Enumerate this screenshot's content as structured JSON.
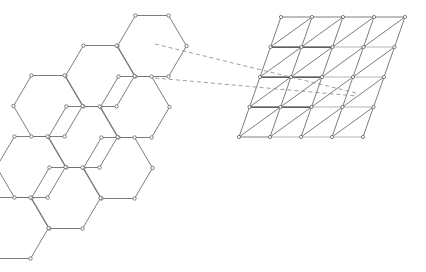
{
  "figure": {
    "background_color": "#ffffff",
    "width": 426,
    "height": 272
  },
  "colors": {
    "edge_normal": "#6e6e6e",
    "edge_dark": "#2a2a2a",
    "edge_light": "#b4b4b4",
    "node_fill": "#ffffff",
    "node_stroke": "#5a5a5a",
    "callout": "#8d8d8d"
  },
  "chart_data": {
    "type": "diagram",
    "xlabel": "",
    "ylabel": "",
    "grid": false,
    "legend": "none",
    "panels": [
      {
        "name": "honeycomb-lattice",
        "lattice_type": "honeycomb",
        "shape": "rhombus",
        "rows": 3,
        "cols": 3,
        "cell_count": 9,
        "vertex_count": 54,
        "hex_radius_x": 34.5,
        "hex_radius_y": 30.5,
        "origin": [
          152,
          46
        ],
        "col_step": [
          -52,
          30
        ],
        "row_step": [
          -17,
          61
        ]
      },
      {
        "name": "triangular-lattice",
        "lattice_type": "triangular",
        "shape": "rhombus",
        "rows": 4,
        "cols": 4,
        "node_rows": 5,
        "node_cols": 5,
        "triangle_count": 32,
        "origin": [
          281,
          17
        ],
        "col_step": [
          31,
          0
        ],
        "row_step": [
          -10.5,
          30
        ]
      }
    ],
    "callout_lines": [
      {
        "name": "callout-upper",
        "from": [
          155,
          44
        ],
        "to": [
          356,
          93
        ],
        "style": "dashed"
      },
      {
        "name": "callout-lower",
        "from": [
          155,
          78
        ],
        "to": [
          356,
          96
        ],
        "style": "dashed"
      }
    ],
    "highlighted_rows": [
      {
        "row": 1,
        "dark_from_col": 0,
        "dark_to_col": 2,
        "light_from_col": 2,
        "light_to_col": 4
      },
      {
        "row": 2,
        "dark_from_col": 0,
        "dark_to_col": 2,
        "light_from_col": 2,
        "light_to_col": 4
      },
      {
        "row": 3,
        "dark_from_col": 0,
        "dark_to_col": 2,
        "light_from_col": 2,
        "light_to_col": 4
      },
      {
        "row": 4,
        "dark_from_col": 1,
        "dark_to_col": 1,
        "light_from_col": 1,
        "light_to_col": 4
      }
    ]
  }
}
